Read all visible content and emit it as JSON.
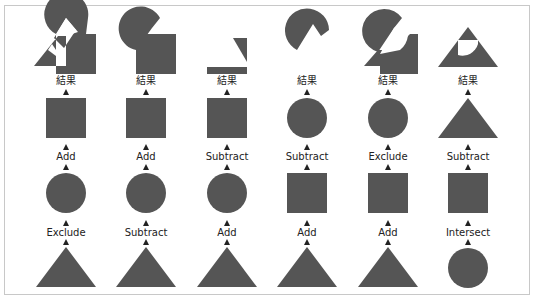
{
  "colors": {
    "shape_fill": "#555555",
    "arrow": "#222222",
    "border": "#c8c8c8",
    "text": "#222222",
    "background": "#ffffff"
  },
  "result_label": "結果",
  "columns": [
    {
      "result": "circle+square+triangle (add, then exclude overlap with triangle)",
      "ops": [
        "Add",
        "Exclude"
      ],
      "shapes": [
        "square",
        "circle",
        "triangle"
      ]
    },
    {
      "result": "circle+square minus triangle",
      "ops": [
        "Add",
        "Subtract"
      ],
      "shapes": [
        "square",
        "circle",
        "triangle"
      ]
    },
    {
      "result": "square minus (circle+triangle)",
      "ops": [
        "Subtract",
        "Add"
      ],
      "shapes": [
        "square",
        "circle",
        "triangle"
      ]
    },
    {
      "result": "circle minus (square+triangle)",
      "ops": [
        "Subtract",
        "Add"
      ],
      "shapes": [
        "circle",
        "square",
        "triangle"
      ]
    },
    {
      "result": "circle exclude (square+triangle)",
      "ops": [
        "Exclude",
        "Add"
      ],
      "shapes": [
        "circle",
        "square",
        "triangle"
      ]
    },
    {
      "result": "triangle minus (square intersect circle)",
      "ops": [
        "Subtract",
        "Intersect"
      ],
      "shapes": [
        "triangle",
        "square",
        "circle"
      ]
    }
  ],
  "labels": {
    "c0": {
      "result": "結果",
      "op1": "Add",
      "op2": "Exclude"
    },
    "c1": {
      "result": "結果",
      "op1": "Add",
      "op2": "Subtract"
    },
    "c2": {
      "result": "結果",
      "op1": "Subtract",
      "op2": "Add"
    },
    "c3": {
      "result": "結果",
      "op1": "Subtract",
      "op2": "Add"
    },
    "c4": {
      "result": "結果",
      "op1": "Exclude",
      "op2": "Add"
    },
    "c5": {
      "result": "結果",
      "op1": "Subtract",
      "op2": "Intersect"
    }
  }
}
